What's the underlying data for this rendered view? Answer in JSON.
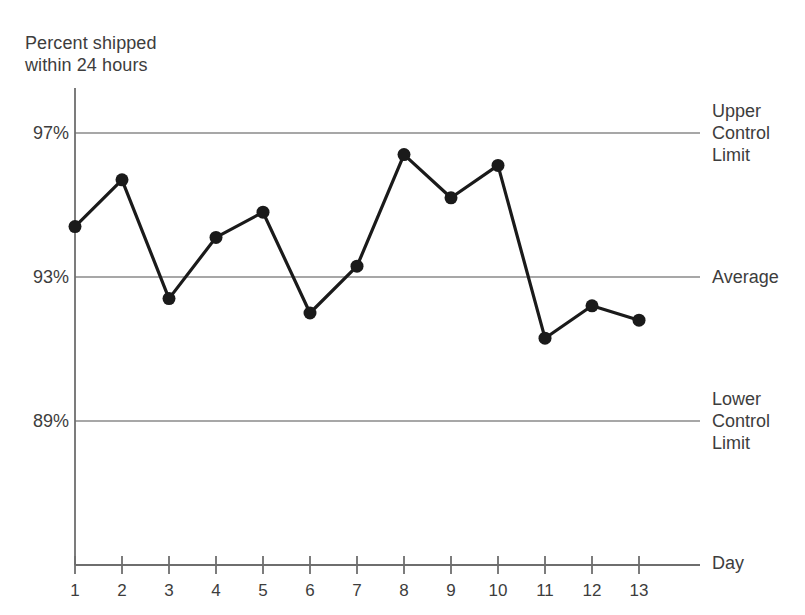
{
  "axis_title": "Percent shipped\nwithin 24 hours",
  "x_axis_name": "Day",
  "reference_lines": [
    {
      "name": "upper-control-limit",
      "label": "Upper\nControl\nLimit",
      "value": 97,
      "tick_label": "97%"
    },
    {
      "name": "average",
      "label": "Average",
      "value": 93,
      "tick_label": "93%"
    },
    {
      "name": "lower-control-limit",
      "label": "Lower\nControl\nLimit",
      "value": 89,
      "tick_label": "89%"
    }
  ],
  "colors": {
    "series": "#1a1a1a",
    "gridline": "#8a8a8a",
    "axis": "#6e6e6e",
    "text": "#3d3d3d",
    "background": "#ffffff"
  },
  "chart_data": {
    "type": "line",
    "title": "Percent shipped within 24 hours",
    "xlabel": "Day",
    "ylabel": "Percent shipped within 24 hours",
    "x": [
      1,
      2,
      3,
      4,
      5,
      6,
      7,
      8,
      9,
      10,
      11,
      12,
      13
    ],
    "categories": [
      "1",
      "2",
      "3",
      "4",
      "5",
      "6",
      "7",
      "8",
      "9",
      "10",
      "11",
      "12",
      "13"
    ],
    "values": [
      94.4,
      95.7,
      92.4,
      94.1,
      94.8,
      92.0,
      93.3,
      96.4,
      95.2,
      96.1,
      91.3,
      92.2,
      91.8
    ],
    "series": [
      {
        "name": "Percent shipped within 24 hours",
        "values": [
          94.4,
          95.7,
          92.4,
          94.1,
          94.8,
          92.0,
          93.3,
          96.4,
          95.2,
          96.1,
          91.3,
          92.2,
          91.8
        ]
      }
    ],
    "ytick_values": [
      97,
      93,
      89
    ],
    "ytick_labels": [
      "97%",
      "93%",
      "89%"
    ],
    "ylim": [
      85.6,
      98.5
    ],
    "xlim": [
      1,
      13
    ],
    "grid": false,
    "legend": "none",
    "control_limits": {
      "upper": 97,
      "average": 93,
      "lower": 89
    },
    "markers": "filled-circle"
  }
}
